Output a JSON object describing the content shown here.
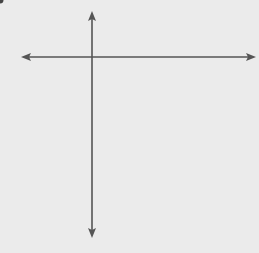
{
  "chart_data": {
    "type": "scatter",
    "title": "",
    "xlabel": "x",
    "ylabel": "y",
    "xlim": [
      -3,
      6
    ],
    "ylim": [
      -8,
      2
    ],
    "grid": true,
    "tick_labels": {
      "x": "1",
      "y": "1"
    },
    "circle": {
      "center": [
        2,
        -3
      ],
      "radius": 4
    },
    "points": [
      {
        "x": 2,
        "y": -3,
        "label": "center"
      }
    ]
  },
  "labels": {
    "x_axis": "x",
    "y_axis": "y",
    "x_tick": "1",
    "y_tick": "1"
  },
  "colors": {
    "background": "#ebebeb",
    "grid": "#a8a8a8",
    "axis": "#555555",
    "curve": "#555555"
  }
}
